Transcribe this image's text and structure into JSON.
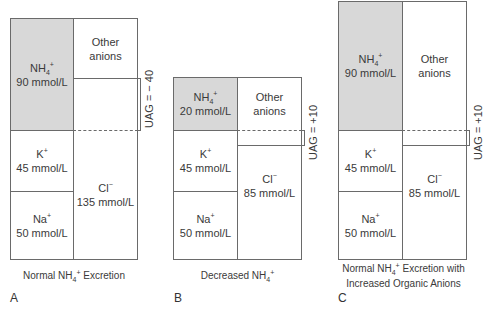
{
  "panels": [
    {
      "letter": "A",
      "caption_line1_pre": "Normal NH",
      "caption_sub": "4",
      "caption_sup": "+",
      "caption_line1_post": " Excretion",
      "caption_line2": "",
      "cations": [
        {
          "ion": "NH",
          "sub": "4",
          "sup": "+",
          "value": "90 mmol/L"
        },
        {
          "ion": "K",
          "sub": "",
          "sup": "+",
          "value": "45 mmol/L"
        },
        {
          "ion": "Na",
          "sub": "",
          "sup": "+",
          "value": "50 mmol/L"
        }
      ],
      "anions": [
        {
          "ion": "Other",
          "value": "anions"
        },
        {
          "ion": "Cl",
          "sup": "−",
          "value": "135 mmol/L"
        }
      ],
      "uag": "UAG = − 40"
    },
    {
      "letter": "B",
      "caption_line1_pre": "Decreased NH",
      "caption_sub": "4",
      "caption_sup": "+",
      "caption_line1_post": "",
      "caption_line2": "",
      "cations": [
        {
          "ion": "NH",
          "sub": "4",
          "sup": "+",
          "value": "20 mmol/L"
        },
        {
          "ion": "K",
          "sub": "",
          "sup": "+",
          "value": "45 mmol/L"
        },
        {
          "ion": "Na",
          "sub": "",
          "sup": "+",
          "value": "50 mmol/L"
        }
      ],
      "anions": [
        {
          "ion": "Other",
          "value": "anions"
        },
        {
          "ion": "Cl",
          "sup": "−",
          "value": "85 mmol/L"
        }
      ],
      "uag": "UAG = +10"
    },
    {
      "letter": "C",
      "caption_line1_pre": "Normal NH",
      "caption_sub": "4",
      "caption_sup": "+",
      "caption_line1_post": " Excretion with",
      "caption_line2": "Increased Organic Anions",
      "cations": [
        {
          "ion": "NH",
          "sub": "4",
          "sup": "+",
          "value": "90 mmol/L"
        },
        {
          "ion": "K",
          "sub": "",
          "sup": "+",
          "value": "45 mmol/L"
        },
        {
          "ion": "Na",
          "sub": "",
          "sup": "+",
          "value": "50 mmol/L"
        }
      ],
      "anions": [
        {
          "ion": "Other",
          "value": "anions"
        },
        {
          "ion": "Cl",
          "sup": "−",
          "value": "85 mmol/L"
        }
      ],
      "uag": "UAG = +10"
    }
  ],
  "colors": {
    "nh4_fill": "#d8d8d8",
    "line": "#6a6a6a",
    "text": "#3a3a3a"
  }
}
